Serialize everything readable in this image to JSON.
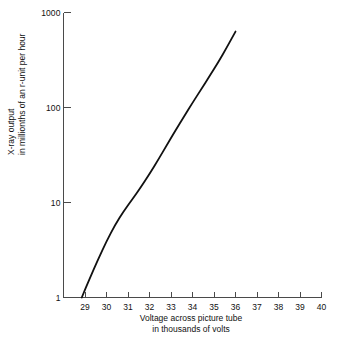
{
  "chart_data": {
    "type": "line",
    "title": "",
    "subtitle": "",
    "xlabel": "Voltage across picture tube\nin thousands of volts",
    "ylabel": "X-ray output\nin millionths of an r-unit per hour",
    "xlabel_line1": "Voltage across picture tube",
    "xlabel_line2": "in thousands of volts",
    "ylabel_line1": "X-ray output",
    "ylabel_line2": "in millionths of an r-unit per hour",
    "xscale": "linear",
    "yscale": "log",
    "xlim": [
      28.0,
      40.0
    ],
    "ylim": [
      1,
      1000
    ],
    "grid": false,
    "legend": false,
    "xticks": [
      29,
      30,
      31,
      32,
      33,
      34,
      35,
      36,
      37,
      38,
      39,
      40
    ],
    "xtick_labels": [
      "29",
      "30",
      "31",
      "32",
      "33",
      "34",
      "35",
      "36",
      "37",
      "38",
      "39",
      "40"
    ],
    "yticks": [
      1,
      10,
      100,
      1000
    ],
    "ytick_labels": [
      "1",
      "10",
      "100",
      "1000"
    ],
    "series": [
      {
        "name": "X-ray output vs tube voltage",
        "color": "#111111",
        "x": [
          28.85,
          29.2,
          29.6,
          30.0,
          30.4,
          30.8,
          31.2,
          31.6,
          32.0,
          32.4,
          32.8,
          33.2,
          33.6,
          34.0,
          34.4,
          34.8,
          35.2,
          35.6,
          36.0
        ],
        "y": [
          1.0,
          1.55,
          2.5,
          3.9,
          5.8,
          8.1,
          10.8,
          14.5,
          20.0,
          28.0,
          40.0,
          57.0,
          80.0,
          112.0,
          155.0,
          215.0,
          300.0,
          430.0,
          630.0
        ]
      }
    ]
  },
  "axes": {
    "axis_color": "#4a4a4a",
    "line_color": "#111111",
    "background": "#ffffff"
  }
}
